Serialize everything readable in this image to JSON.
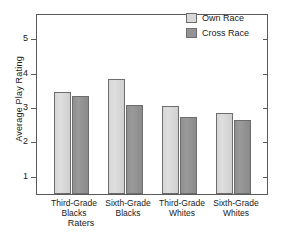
{
  "chart_data": {
    "type": "bar",
    "title": "",
    "xlabel": "Raters",
    "ylabel": "Average Play Rating",
    "categories": [
      "Third-Grade Blacks",
      "Sixth-Grade Blacks",
      "Third-Grade Whites",
      "Sixth-Grade Whites"
    ],
    "category_lines": [
      {
        "line1": "Third-Grade",
        "line2": "Blacks"
      },
      {
        "line1": "Sixth-Grade",
        "line2": "Blacks"
      },
      {
        "line1": "Third-Grade",
        "line2": "Whites"
      },
      {
        "line1": "Sixth-Grade",
        "line2": "Whites"
      }
    ],
    "series": [
      {
        "name": "Own Race",
        "color": "#d8d8d8",
        "values": [
          3.45,
          3.83,
          3.05,
          2.85
        ]
      },
      {
        "name": "Cross Race",
        "color": "#949494",
        "values": [
          3.35,
          3.1,
          2.75,
          2.65
        ]
      }
    ],
    "ylim": [
      0.5,
      5.7
    ],
    "yticks": [
      1,
      2,
      3,
      4,
      5
    ],
    "ytick_labels": [
      "1",
      "2",
      "3",
      "4",
      "5"
    ],
    "grid": false,
    "legend_position": "top-right",
    "legend": [
      "Own Race",
      "Cross Race"
    ]
  },
  "legend": {
    "own_label": "Own Race",
    "cross_label": "Cross Race"
  },
  "axes": {
    "y_title": "Average Play Rating",
    "x_title": "Raters"
  }
}
